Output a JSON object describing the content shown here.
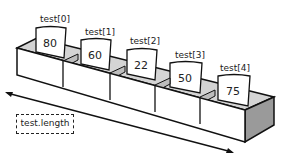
{
  "diagram": {
    "array_name": "test",
    "elements": [
      {
        "label": "test[0]",
        "value": "80"
      },
      {
        "label": "test[1]",
        "value": "60"
      },
      {
        "label": "test[2]",
        "value": "22"
      },
      {
        "label": "test[3]",
        "value": "50"
      },
      {
        "label": "test[4]",
        "value": "75"
      }
    ],
    "length_label": "test.length"
  },
  "colors": {
    "stroke": "#111111",
    "shade_light": "#d4d4d4",
    "shade_dark": "#9a9a9a",
    "face": "#ffffff"
  }
}
